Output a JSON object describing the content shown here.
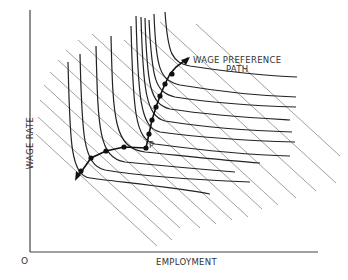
{
  "diagram": {
    "axes": {
      "y_label": "WAGE RATE",
      "x_label": "EMPLOYMENT",
      "origin_label": "O"
    },
    "annotations": {
      "path_label_line1": "WAGE PREFERENCE",
      "path_label_line2": "PATH",
      "point_label": "P"
    },
    "colors": {
      "ink": "#222222",
      "grid": "#777777",
      "background": "#ffffff"
    },
    "elements": {
      "diagonal_lines": "parallel downward-sloping iso-wage-bill / budget lines",
      "indifference_curves": "L-shaped union indifference curves",
      "path_points": 11
    }
  }
}
